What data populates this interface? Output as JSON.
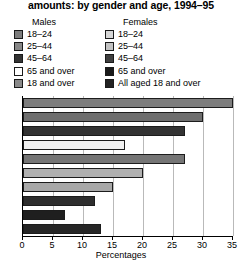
{
  "chart_data": {
    "type": "bar",
    "orientation": "horizontal",
    "title": "amounts: by gender and age, 1994–95",
    "xlabel": "Percentages",
    "ylabel": "",
    "xlim": [
      0,
      35
    ],
    "xticks": [
      0,
      5,
      10,
      15,
      20,
      25,
      30,
      35
    ],
    "xtick_labels": [
      "0",
      "5",
      "10",
      "15",
      "20",
      "25",
      "30",
      "35"
    ],
    "grid": true,
    "grid_axis": "x",
    "legend_position": "top",
    "legend_groups": [
      {
        "heading": "Males",
        "entries": [
          {
            "label": "18–24",
            "color": "#7d7d7d"
          },
          {
            "label": "25–44",
            "color": "#878787"
          },
          {
            "label": "45–64",
            "color": "#333333"
          },
          {
            "label": "65 and over",
            "color": "#ffffff"
          },
          {
            "label": "18 and over",
            "color": "#8a8a8a"
          }
        ]
      },
      {
        "heading": "Females",
        "entries": [
          {
            "label": "18–24",
            "color": "#d6d6d6"
          },
          {
            "label": "25–44",
            "color": "#c2c2c2"
          },
          {
            "label": "45–64",
            "color": "#3f3f3f"
          },
          {
            "label": "65 and over",
            "color": "#1a1a1a"
          },
          {
            "label": "All aged 18 and over",
            "color": "#222222"
          }
        ]
      }
    ],
    "categories": [
      "Males 18–24",
      "Males 25–44",
      "Males 45–64",
      "Males 65 and over",
      "Males 18 and over",
      "Females 18–24",
      "Females 25–44",
      "Females 45–64",
      "Females 65 and over",
      "Females all aged 18 and over"
    ],
    "values": [
      35,
      30,
      27,
      17,
      27,
      20,
      15,
      12,
      7,
      13
    ],
    "bar_colors": [
      "#7d7d7d",
      "#6e6e6e",
      "#333333",
      "#f2f2f2",
      "#757575",
      "#b0b0b0",
      "#a8a8a8",
      "#2e2e2e",
      "#1f1f1f",
      "#262626"
    ]
  }
}
